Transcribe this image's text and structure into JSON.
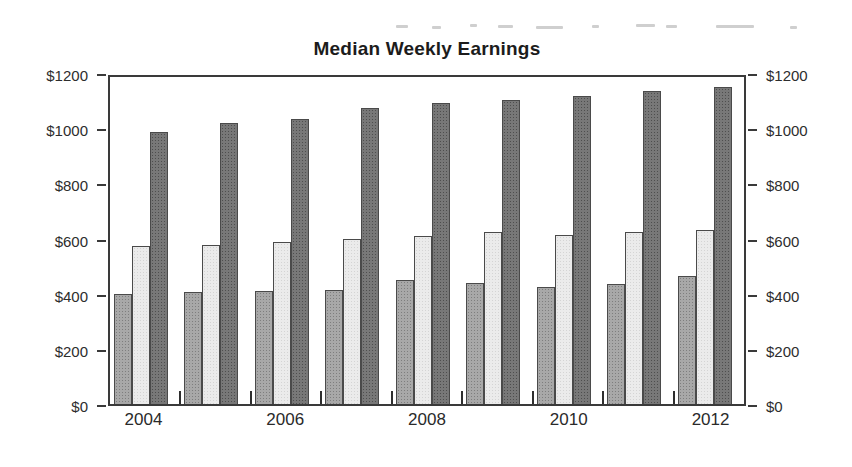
{
  "page": {
    "background_color": "#ffffff",
    "artifact_note": "faint gray scan smudge dashes near top edge"
  },
  "chart_data": {
    "type": "bar",
    "title": "Median Weekly Earnings",
    "categories": [
      "2004",
      "2005",
      "2006",
      "2007",
      "2008",
      "2009",
      "2010",
      "2011",
      "2012"
    ],
    "series": [
      {
        "name": "medium-gray-bars",
        "color": "#a8a8a8",
        "values": [
          405,
          410,
          415,
          420,
          455,
          445,
          430,
          440,
          470
        ]
      },
      {
        "name": "light-gray-bars",
        "color": "#ebebeb",
        "values": [
          580,
          585,
          595,
          605,
          615,
          630,
          620,
          630,
          640
        ]
      },
      {
        "name": "dark-gray-bars",
        "color": "#787878",
        "values": [
          1000,
          1030,
          1045,
          1085,
          1105,
          1115,
          1130,
          1150,
          1165
        ]
      }
    ],
    "ylim": [
      0,
      1200
    ],
    "y_tick_step": 200,
    "y_tick_labels": [
      "$1200",
      "$1000",
      "$800",
      "$600",
      "$400",
      "$200",
      "$0"
    ],
    "y_axis_sides": "both",
    "x_tick_labels_shown": [
      "2004",
      "2006",
      "2008",
      "2010",
      "2012"
    ],
    "xlabel": "",
    "ylabel": "",
    "legend": "none",
    "grid": "off",
    "bar_style": "halftone-dither, thin dark outline",
    "frame": "full rectangle border, inner ticks at group boundaries"
  }
}
